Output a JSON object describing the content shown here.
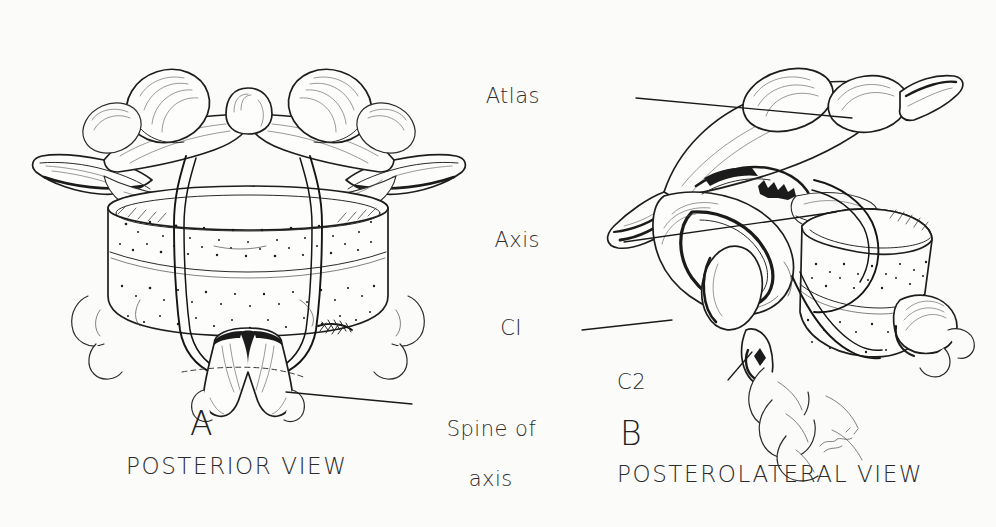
{
  "figure": {
    "background_color": "#fbfbfa",
    "ink_color": "#1b1b1b",
    "text_color": "#2d2d2d"
  },
  "panel_a": {
    "letter": "A",
    "view_caption": "POSTERIOR VIEW",
    "callouts": [
      {
        "name": "spine-of-axis",
        "line1": "Spine of",
        "line2": "axis"
      }
    ]
  },
  "panel_b": {
    "letter": "B",
    "view_caption": "POSTEROLATERAL VIEW",
    "callouts": [
      {
        "name": "atlas",
        "text": "Atlas"
      },
      {
        "name": "axis",
        "text": "Axis"
      },
      {
        "name": "c1",
        "text": "CI"
      },
      {
        "name": "c2",
        "text": "C2"
      }
    ]
  }
}
